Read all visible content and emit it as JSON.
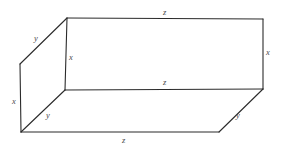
{
  "figure": {
    "kind": "rectangular-box-wireframe",
    "stroke_color": "#2b2b2b",
    "label_color": "#4a4a4a",
    "background_color": "#ffffff",
    "canvas": {
      "width": 283,
      "height": 150
    },
    "vertices": {
      "top_front_left": {
        "x": 67,
        "y": 18
      },
      "top_front_right": {
        "x": 263,
        "y": 19
      },
      "top_back_left": {
        "x": 20,
        "y": 64
      },
      "mid_front_left": {
        "x": 65,
        "y": 90
      },
      "mid_front_right": {
        "x": 263,
        "y": 89
      },
      "bottom_back_left": {
        "x": 21,
        "y": 132
      },
      "bottom_back_right": {
        "x": 219,
        "y": 132
      }
    },
    "edges": [
      {
        "name": "top-far-edge",
        "label": "z",
        "from": "top_front_left",
        "to": "top_front_right"
      },
      {
        "name": "top-left-receding-edge",
        "label": "y",
        "from": "top_front_left",
        "to": "top_back_left"
      },
      {
        "name": "front-left-vertical-edge",
        "label": "x",
        "from": "top_front_left",
        "to": "mid_front_left"
      },
      {
        "name": "right-vertical-edge",
        "label": "x",
        "from": "top_front_right",
        "to": "mid_front_right"
      },
      {
        "name": "middle-horizontal-edge",
        "label": "z",
        "from": "mid_front_left",
        "to": "mid_front_right"
      },
      {
        "name": "back-left-vertical-edge",
        "label": "x",
        "from": "top_back_left",
        "to": "bottom_back_left"
      },
      {
        "name": "bottom-left-receding-edge",
        "label": "y",
        "from": "mid_front_left",
        "to": "bottom_back_left"
      },
      {
        "name": "bottom-near-edge",
        "label": "z",
        "from": "bottom_back_left",
        "to": "bottom_back_right"
      },
      {
        "name": "bottom-right-receding-edge",
        "label": "y",
        "from": "bottom_back_right",
        "to": "mid_front_right"
      }
    ],
    "labels": [
      {
        "name": "label-z-top",
        "text": "z",
        "x": 163,
        "y": 8
      },
      {
        "name": "label-y-top-left",
        "text": "y",
        "x": 34,
        "y": 34
      },
      {
        "name": "label-x-front-left",
        "text": "x",
        "x": 69,
        "y": 53
      },
      {
        "name": "label-x-right",
        "text": "x",
        "x": 266,
        "y": 48
      },
      {
        "name": "label-z-middle",
        "text": "z",
        "x": 163,
        "y": 78
      },
      {
        "name": "label-x-back-left",
        "text": "x",
        "x": 12,
        "y": 97
      },
      {
        "name": "label-y-bottom-left",
        "text": "y",
        "x": 46,
        "y": 111
      },
      {
        "name": "label-y-bottom-right",
        "text": "y",
        "x": 236,
        "y": 111
      },
      {
        "name": "label-z-bottom",
        "text": "z",
        "x": 122,
        "y": 136
      }
    ]
  }
}
